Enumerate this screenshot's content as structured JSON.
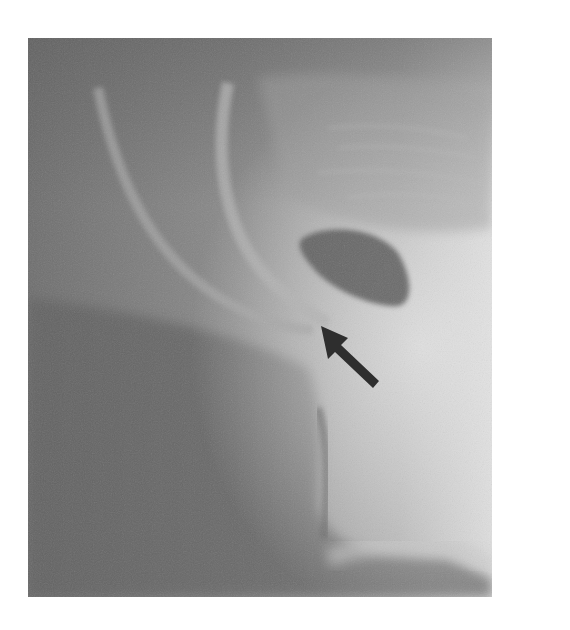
{
  "figure": {
    "type": "grayscale radiograph",
    "annotation": "arrow",
    "arrow_icon": "arrow-pointing-up-left"
  }
}
